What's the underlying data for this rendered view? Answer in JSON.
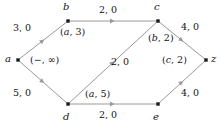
{
  "diagram": {
    "type": "flow-network-graph",
    "title": "",
    "stroke_color": "#9a9a9a",
    "node_color": "#1a1a1a",
    "text_color": "#141414",
    "background": "#ffffff",
    "nodes": [
      {
        "id": "a",
        "label": "a",
        "x": 18,
        "y": 60,
        "label_x": 5,
        "label_y": 54
      },
      {
        "id": "b",
        "label": "b",
        "x": 68,
        "y": 21,
        "label_x": 63,
        "label_y": 2
      },
      {
        "id": "c",
        "label": "c",
        "x": 158,
        "y": 21,
        "label_x": 154,
        "label_y": 2
      },
      {
        "id": "d",
        "label": "d",
        "x": 68,
        "y": 104,
        "label_x": 63,
        "label_y": 112
      },
      {
        "id": "e",
        "label": "e",
        "x": 158,
        "y": 104,
        "label_x": 153,
        "label_y": 112
      },
      {
        "id": "z",
        "label": "z",
        "x": 206,
        "y": 60,
        "label_x": 211,
        "label_y": 54
      }
    ],
    "edges": [
      {
        "from": "a",
        "to": "b",
        "weight": "3, 0",
        "weight_x": 13,
        "weight_y": 23
      },
      {
        "from": "b",
        "to": "c",
        "weight": "2, 0",
        "weight_x": 99,
        "weight_y": 5
      },
      {
        "from": "c",
        "to": "z",
        "weight": "4, 0",
        "weight_x": 181,
        "weight_y": 22
      },
      {
        "from": "a",
        "to": "d",
        "weight": "5, 0",
        "weight_x": 13,
        "weight_y": 88
      },
      {
        "from": "d",
        "to": "e",
        "weight": "2, 0",
        "weight_x": 99,
        "weight_y": 110
      },
      {
        "from": "e",
        "to": "z",
        "weight": "4, 0",
        "weight_x": 181,
        "weight_y": 88
      },
      {
        "from": "d",
        "to": "c",
        "weight": "2, 0",
        "weight_x": 111,
        "weight_y": 57
      }
    ],
    "node_annotations": [
      {
        "node": "a",
        "text": "(−, ∞)",
        "x": 30,
        "y": 55
      },
      {
        "node": "b",
        "text": "(a, 3)",
        "x": 60,
        "y": 27
      },
      {
        "node": "c",
        "text": "(b, 2)",
        "x": 148,
        "y": 33
      },
      {
        "node": "z",
        "text": "(c, 2)",
        "x": 162,
        "y": 55
      },
      {
        "node": "d",
        "text": "(a, 5)",
        "x": 85,
        "y": 89
      }
    ],
    "arrow_markers": [
      {
        "edge": "a-b",
        "x": 43,
        "y": 40.5,
        "angle": -38
      },
      {
        "edge": "b-c",
        "x": 113,
        "y": 21,
        "angle": 0
      },
      {
        "edge": "c-z",
        "x": 182,
        "y": 40.5,
        "angle": 38
      },
      {
        "edge": "a-d",
        "x": 43,
        "y": 82,
        "angle": 38
      },
      {
        "edge": "d-e",
        "x": 113,
        "y": 104,
        "angle": 0
      },
      {
        "edge": "e-z",
        "x": 182,
        "y": 82,
        "angle": -38
      },
      {
        "edge": "d-c",
        "x": 113,
        "y": 62.5,
        "angle": -38
      }
    ]
  }
}
